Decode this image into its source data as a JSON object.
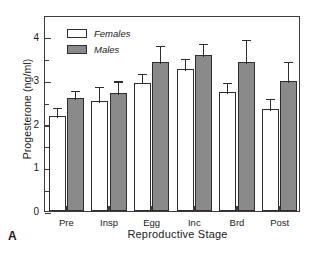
{
  "panel": {
    "label": "A"
  },
  "chart_data": {
    "type": "bar",
    "title": "",
    "xlabel": "Reproductive Stage",
    "ylabel": "Progesterone (ng/ml)",
    "categories": [
      "Pre",
      "Insp",
      "Egg",
      "Inc",
      "Brd",
      "Post"
    ],
    "ylim": [
      0,
      4.5
    ],
    "yticks": [
      0,
      1,
      2,
      3,
      4
    ],
    "ytick_labels": [
      "0",
      "1",
      "2",
      "3",
      "4"
    ],
    "yminor_ticks": [
      0.5,
      1.5,
      2.5,
      3.5
    ],
    "grid": false,
    "legend_position": "top-left",
    "series": [
      {
        "name": "Females",
        "color": "#ffffff",
        "edge_color": "#2e2e2e",
        "values": [
          2.19,
          2.53,
          2.95,
          3.26,
          2.74,
          2.34
        ],
        "errors": [
          0.23,
          0.36,
          0.25,
          0.27,
          0.25,
          0.28
        ]
      },
      {
        "name": "Males",
        "color": "#8a8a8a",
        "edge_color": "#2e2e2e",
        "values": [
          2.59,
          2.72,
          3.43,
          3.58,
          3.41,
          2.99
        ],
        "errors": [
          0.22,
          0.3,
          0.4,
          0.31,
          0.56,
          0.48
        ]
      }
    ]
  }
}
